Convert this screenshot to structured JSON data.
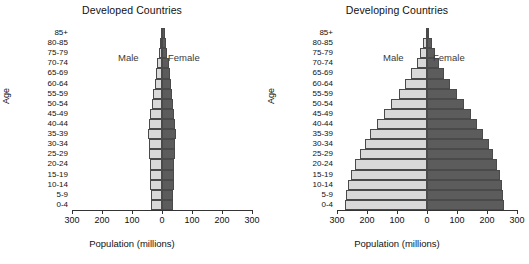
{
  "figure": {
    "xlabel": "Population (millions)",
    "ylabel": "Age",
    "male_label": "Male",
    "female_label": "Female",
    "male_color": "#d9d9d9",
    "female_color": "#5c5c5c",
    "tick_labels": [
      "300",
      "200",
      "100",
      "0",
      "100",
      "200",
      "300"
    ],
    "tick_values": [
      -300,
      -200,
      -100,
      0,
      100,
      200,
      300
    ],
    "age_groups": [
      "85+",
      "80-85",
      "75-79",
      "70-74",
      "65-69",
      "60-64",
      "55-59",
      "50-54",
      "45-49",
      "40-44",
      "35-39",
      "30-34",
      "25-29",
      "20-24",
      "15-19",
      "10-14",
      "5-9",
      "0-4"
    ]
  },
  "chart_data": [
    {
      "type": "bar",
      "title": "Developed Countries",
      "xlabel": "Population (millions)",
      "ylabel": "Age",
      "xlim": [
        -300,
        300
      ],
      "grid": false,
      "orientation": "horizontal-diverging",
      "legend_position": "inside-top",
      "categories": [
        "85+",
        "80-85",
        "75-79",
        "70-74",
        "65-69",
        "60-64",
        "55-59",
        "50-54",
        "45-49",
        "40-44",
        "35-39",
        "30-34",
        "25-29",
        "20-24",
        "15-19",
        "10-14",
        "5-9",
        "0-4"
      ],
      "series": [
        {
          "name": "Male",
          "values": [
            -4,
            -7,
            -11,
            -16,
            -21,
            -25,
            -30,
            -35,
            -40,
            -44,
            -47,
            -45,
            -42,
            -40,
            -40,
            -40,
            -38,
            -36
          ]
        },
        {
          "name": "Female",
          "values": [
            9,
            13,
            18,
            22,
            26,
            29,
            32,
            36,
            40,
            44,
            46,
            44,
            42,
            40,
            39,
            39,
            37,
            35
          ]
        }
      ]
    },
    {
      "type": "bar",
      "title": "Developing Countries",
      "xlabel": "Population (millions)",
      "ylabel": "Age",
      "xlim": [
        -300,
        300
      ],
      "grid": false,
      "orientation": "horizontal-diverging",
      "legend_position": "inside-top",
      "categories": [
        "85+",
        "80-85",
        "75-79",
        "70-74",
        "65-69",
        "60-64",
        "55-59",
        "50-54",
        "45-49",
        "40-44",
        "35-39",
        "30-34",
        "25-29",
        "20-24",
        "15-19",
        "10-14",
        "5-9",
        "0-4"
      ],
      "series": [
        {
          "name": "Male",
          "values": [
            -5,
            -12,
            -22,
            -35,
            -52,
            -72,
            -95,
            -120,
            -145,
            -168,
            -190,
            -208,
            -225,
            -240,
            -253,
            -263,
            -270,
            -272
          ]
        },
        {
          "name": "Female",
          "values": [
            7,
            15,
            26,
            40,
            57,
            77,
            99,
            122,
            146,
            168,
            188,
            205,
            220,
            233,
            243,
            250,
            254,
            255
          ]
        }
      ]
    }
  ]
}
